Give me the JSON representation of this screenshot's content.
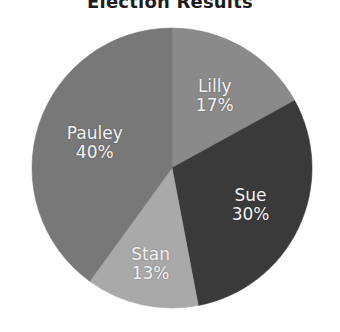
{
  "chart_data": {
    "type": "pie",
    "title": "Election Results",
    "xlabel": "",
    "ylabel": "",
    "legend": "none",
    "grid": false,
    "start_angle_deg": 0,
    "direction": "clockwise",
    "categories": [
      "Lilly",
      "Sue",
      "Stan",
      "Pauley"
    ],
    "values": [
      17,
      30,
      13,
      40
    ],
    "value_unit": "percent",
    "slices": [
      {
        "label": "Lilly",
        "value": 17,
        "value_text": "17%",
        "color": "#8a8a8a"
      },
      {
        "label": "Sue",
        "value": 30,
        "value_text": "30%",
        "color": "#3a3a3a"
      },
      {
        "label": "Stan",
        "value": 13,
        "value_text": "13%",
        "color": "#a9a9a9"
      },
      {
        "label": "Pauley",
        "value": 40,
        "value_text": "40%",
        "color": "#787878"
      }
    ]
  },
  "colors": {
    "background": "#ffffff",
    "title": "#1d1d1d",
    "label_text": "#f2f2f2"
  }
}
